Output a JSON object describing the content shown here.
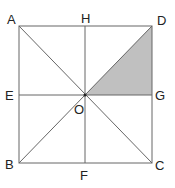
{
  "diagram": {
    "type": "geometry",
    "colors": {
      "line": "#666666",
      "shade": "#c0c0c0",
      "label": "#222222",
      "background": "#ffffff"
    },
    "points": {
      "A": {
        "x": 19,
        "y": 26
      },
      "D": {
        "x": 152,
        "y": 26
      },
      "B": {
        "x": 19,
        "y": 163
      },
      "C": {
        "x": 152,
        "y": 163
      },
      "H": {
        "x": 85,
        "y": 26
      },
      "F": {
        "x": 85,
        "y": 163
      },
      "E": {
        "x": 19,
        "y": 95
      },
      "G": {
        "x": 152,
        "y": 95
      },
      "O": {
        "x": 85,
        "y": 95
      }
    },
    "labels": {
      "A": "A",
      "H": "H",
      "D": "D",
      "E": "E",
      "O": "O",
      "G": "G",
      "B": "B",
      "F": "F",
      "C": "C"
    },
    "segments": [
      [
        "A",
        "D"
      ],
      [
        "D",
        "C"
      ],
      [
        "C",
        "B"
      ],
      [
        "B",
        "A"
      ],
      [
        "A",
        "C"
      ],
      [
        "B",
        "D"
      ],
      [
        "H",
        "F"
      ],
      [
        "E",
        "G"
      ]
    ],
    "shaded_region": [
      "O",
      "D",
      "G"
    ]
  }
}
